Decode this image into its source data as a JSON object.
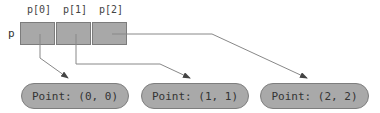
{
  "array": {
    "name": "p",
    "indices": [
      "p[0]",
      "p[1]",
      "p[2]"
    ]
  },
  "nodes": [
    {
      "label": "Point: (0, 0)"
    },
    {
      "label": "Point: (1, 1)"
    },
    {
      "label": "Point: (2, 2)"
    }
  ],
  "colors": {
    "cell": "#a8a8a8",
    "node": "#a9a9a9",
    "line": "#888888"
  }
}
